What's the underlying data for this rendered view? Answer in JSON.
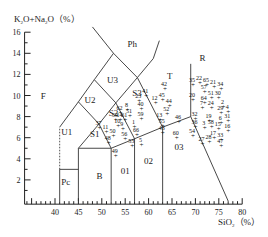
{
  "chart_data": {
    "type": "scatter",
    "xlabel": "SiO2 (%)",
    "ylabel": "K2O+Na2O (%)",
    "xlim": [
      35,
      80
    ],
    "ylim": [
      0,
      16
    ],
    "x_ticks": [
      40,
      45,
      50,
      55,
      60,
      65,
      70,
      75,
      80
    ],
    "y_ticks": [
      2,
      4,
      6,
      8,
      10,
      12,
      14,
      16
    ],
    "grid": false,
    "legend": null,
    "fields": [
      "F",
      "Ph",
      "U3",
      "U2",
      "U1",
      "S3",
      "S2",
      "S1",
      "T",
      "R",
      "Pc",
      "B",
      "01",
      "02",
      "03"
    ],
    "points": [
      {
        "id": "35",
        "x": 69.5,
        "y": 11.0
      },
      {
        "id": "22",
        "x": 71.0,
        "y": 11.2
      },
      {
        "id": "65",
        "x": 72.5,
        "y": 11.0
      },
      {
        "id": "21",
        "x": 74.0,
        "y": 10.8
      },
      {
        "id": "34",
        "x": 75.5,
        "y": 10.6
      },
      {
        "id": "57",
        "x": 72.0,
        "y": 10.3
      },
      {
        "id": "51",
        "x": 73.5,
        "y": 9.8
      },
      {
        "id": "30",
        "x": 75.0,
        "y": 9.8
      },
      {
        "id": "20",
        "x": 69.5,
        "y": 9.6
      },
      {
        "id": "64",
        "x": 72.0,
        "y": 9.3
      },
      {
        "id": "7",
        "x": 71.5,
        "y": 8.8
      },
      {
        "id": "24",
        "x": 73.5,
        "y": 8.8
      },
      {
        "id": "2",
        "x": 76.0,
        "y": 8.9
      },
      {
        "id": "29",
        "x": 75.5,
        "y": 8.3
      },
      {
        "id": "4",
        "x": 77.0,
        "y": 8.4
      },
      {
        "id": "32",
        "x": 70.0,
        "y": 7.8
      },
      {
        "id": "19",
        "x": 73.0,
        "y": 7.6
      },
      {
        "id": "6",
        "x": 75.5,
        "y": 7.4
      },
      {
        "id": "31",
        "x": 77.0,
        "y": 7.6
      },
      {
        "id": "36",
        "x": 70.0,
        "y": 7.0
      },
      {
        "id": "3",
        "x": 72.0,
        "y": 6.9
      },
      {
        "id": "58",
        "x": 73.5,
        "y": 7.0
      },
      {
        "id": "15",
        "x": 75.0,
        "y": 6.8
      },
      {
        "id": "16",
        "x": 77.0,
        "y": 6.6
      },
      {
        "id": "54",
        "x": 69.5,
        "y": 6.2
      },
      {
        "id": "17",
        "x": 74.0,
        "y": 6.0
      },
      {
        "id": "27",
        "x": 71.5,
        "y": 5.4
      },
      {
        "id": "28",
        "x": 73.0,
        "y": 5.6
      },
      {
        "id": "33",
        "x": 75.5,
        "y": 5.8
      },
      {
        "id": "47",
        "x": 75.5,
        "y": 5.2
      },
      {
        "id": "41",
        "x": 59.5,
        "y": 10.0
      },
      {
        "id": "42",
        "x": 63.5,
        "y": 10.6
      },
      {
        "id": "12",
        "x": 61.5,
        "y": 9.3
      },
      {
        "id": "45",
        "x": 63.0,
        "y": 9.6
      },
      {
        "id": "44",
        "x": 64.5,
        "y": 9.0
      },
      {
        "id": "23",
        "x": 58.0,
        "y": 9.5
      },
      {
        "id": "40",
        "x": 58.5,
        "y": 8.7
      },
      {
        "id": "52",
        "x": 64.0,
        "y": 8.2
      },
      {
        "id": "59",
        "x": 58.5,
        "y": 7.8
      },
      {
        "id": "13",
        "x": 62.5,
        "y": 7.7
      },
      {
        "id": "46",
        "x": 66.5,
        "y": 7.5
      },
      {
        "id": "55",
        "x": 63.0,
        "y": 7.1
      },
      {
        "id": "43",
        "x": 63.0,
        "y": 6.4
      },
      {
        "id": "60",
        "x": 66.0,
        "y": 6.0
      },
      {
        "id": "8",
        "x": 55.5,
        "y": 8.6
      },
      {
        "id": "62",
        "x": 54.0,
        "y": 8.3
      },
      {
        "id": "51b",
        "x": 56.0,
        "y": 8.1
      },
      {
        "id": "39",
        "x": 53.0,
        "y": 7.7
      },
      {
        "id": "14",
        "x": 54.0,
        "y": 7.7
      },
      {
        "id": "61",
        "x": 55.0,
        "y": 7.7
      },
      {
        "id": "1",
        "x": 57.0,
        "y": 7.0
      },
      {
        "id": "10",
        "x": 53.5,
        "y": 7.1
      },
      {
        "id": "9",
        "x": 54.5,
        "y": 6.8
      },
      {
        "id": "66",
        "x": 57.5,
        "y": 6.3
      },
      {
        "id": "37",
        "x": 49.5,
        "y": 6.9
      },
      {
        "id": "11",
        "x": 51.0,
        "y": 6.5
      },
      {
        "id": "50",
        "x": 52.5,
        "y": 6.2
      },
      {
        "id": "56",
        "x": 55.0,
        "y": 5.9
      },
      {
        "id": "48",
        "x": 51.5,
        "y": 5.5
      },
      {
        "id": "53",
        "x": 56.5,
        "y": 5.2
      },
      {
        "id": "5",
        "x": 58.5,
        "y": 5.3
      },
      {
        "id": "49",
        "x": 53.0,
        "y": 4.3
      }
    ]
  },
  "axes": {
    "y_title_main": "K",
    "y_title_sub1": "2",
    "y_title_mid": "O+Na",
    "y_title_sub2": "2",
    "y_title_end": "O（%）",
    "x_title_main": "SiO",
    "x_title_sub": "2",
    "x_title_end": "（%）"
  }
}
